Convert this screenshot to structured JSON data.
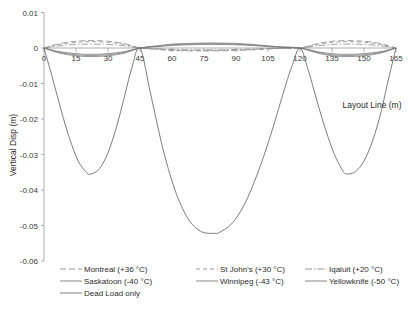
{
  "chart_data": {
    "type": "line",
    "title": "",
    "xlabel": "Layout Line (m)",
    "ylabel": "Vertical Disp (m)",
    "xlim": [
      0,
      165
    ],
    "ylim": [
      -0.06,
      0.01
    ],
    "xticks": [
      0,
      15,
      30,
      45,
      60,
      75,
      90,
      105,
      120,
      135,
      150,
      165
    ],
    "xtick_labels": [
      "0",
      "15",
      "30",
      "45",
      "60",
      "75",
      "90",
      "105",
      "120",
      "135",
      "150",
      "165"
    ],
    "yticks": [
      0.01,
      0,
      -0.01,
      -0.02,
      -0.03,
      -0.04,
      -0.05,
      -0.06
    ],
    "ytick_labels": [
      "0.01",
      "0",
      "-0.01",
      "-0.02",
      "-0.03",
      "-0.04",
      "-0.05",
      "-0.06"
    ],
    "grid": false,
    "legend_position": "bottom",
    "supports": [
      0,
      45,
      120,
      165
    ],
    "series": [
      {
        "name": "Montreal (+36 °C)",
        "label": "Montreal (+36 °C)",
        "color": "#8d8d8d",
        "dash": "6,3",
        "width": 0.8,
        "x": [
          0,
          7,
          15,
          22,
          30,
          38,
          45,
          53,
          60,
          68,
          75,
          82,
          90,
          98,
          105,
          112,
          120,
          128,
          135,
          142,
          150,
          158,
          165
        ],
        "y": [
          0,
          0.0012,
          0.0019,
          0.0021,
          0.0019,
          0.0012,
          0,
          -0.0004,
          -0.0007,
          -0.0008,
          -0.0008,
          -0.0008,
          -0.0007,
          -0.0005,
          -0.0003,
          -0.0001,
          0,
          0.0012,
          0.0019,
          0.0021,
          0.0019,
          0.0012,
          0
        ]
      },
      {
        "name": "St John's (+30 °C)",
        "label": "St John's (+30 °C)",
        "color": "#8d8d8d",
        "dash": "4,3",
        "width": 0.8,
        "x": [
          0,
          7,
          15,
          22,
          30,
          38,
          45,
          53,
          60,
          68,
          75,
          82,
          90,
          98,
          105,
          112,
          120,
          128,
          135,
          142,
          150,
          158,
          165
        ],
        "y": [
          0,
          0.001,
          0.0016,
          0.0018,
          0.0016,
          0.001,
          0,
          -0.0003,
          -0.0006,
          -0.0007,
          -0.0007,
          -0.0007,
          -0.0006,
          -0.0004,
          -0.0002,
          -0.0001,
          0,
          0.001,
          0.0016,
          0.0018,
          0.0016,
          0.001,
          0
        ]
      },
      {
        "name": "Iqaluit (+20 °C)",
        "label": "Iqaluit (+20 °C)",
        "color": "#8d8d8d",
        "dash": "7,2,1.5,2",
        "width": 0.8,
        "x": [
          0,
          7,
          15,
          22,
          30,
          38,
          45,
          53,
          60,
          68,
          75,
          82,
          90,
          98,
          105,
          112,
          120,
          128,
          135,
          142,
          150,
          158,
          165
        ],
        "y": [
          0,
          0.0006,
          0.001,
          0.0011,
          0.001,
          0.0006,
          0,
          -0.0002,
          -0.0004,
          -0.0005,
          -0.0005,
          -0.0005,
          -0.0004,
          -0.0003,
          -0.0001,
          0,
          0,
          0.0006,
          0.001,
          0.0011,
          0.001,
          0.0006,
          0
        ]
      },
      {
        "name": "Saskatoon (-40 °C)",
        "label": "Saskatoon (-40 °C)",
        "color": "#7a7a7a",
        "dash": "",
        "width": 0.8,
        "x": [
          0,
          7,
          15,
          22,
          30,
          38,
          45,
          53,
          60,
          68,
          75,
          82,
          90,
          98,
          105,
          112,
          120,
          128,
          135,
          142,
          150,
          158,
          165
        ],
        "y": [
          0,
          -0.001,
          -0.0016,
          -0.0018,
          -0.0016,
          -0.001,
          0,
          0.0004,
          0.0007,
          0.0009,
          0.001,
          0.001,
          0.0009,
          0.0007,
          0.0004,
          0.0002,
          0,
          -0.001,
          -0.0016,
          -0.0018,
          -0.0016,
          -0.001,
          0
        ]
      },
      {
        "name": "Winnipeg (-43 °C)",
        "label": "Winnipeg (-43 °C)",
        "color": "#7a7a7a",
        "dash": "",
        "width": 0.8,
        "x": [
          0,
          7,
          15,
          22,
          30,
          38,
          45,
          53,
          60,
          68,
          75,
          82,
          90,
          98,
          105,
          112,
          120,
          128,
          135,
          142,
          150,
          158,
          165
        ],
        "y": [
          0,
          -0.0012,
          -0.0019,
          -0.0021,
          -0.0019,
          -0.0012,
          0,
          0.0005,
          0.0009,
          0.0011,
          0.0012,
          0.0012,
          0.0011,
          0.0008,
          0.0005,
          0.0002,
          0,
          -0.0012,
          -0.0019,
          -0.0021,
          -0.0019,
          -0.0012,
          0
        ]
      },
      {
        "name": "Yellowknife (-50 °C)",
        "label": "Yellowknife (-50 °C)",
        "color": "#7a7a7a",
        "dash": "",
        "width": 0.8,
        "x": [
          0,
          7,
          15,
          22,
          30,
          38,
          45,
          53,
          60,
          68,
          75,
          82,
          90,
          98,
          105,
          112,
          120,
          128,
          135,
          142,
          150,
          158,
          165
        ],
        "y": [
          0,
          -0.0014,
          -0.0022,
          -0.0024,
          -0.0022,
          -0.0014,
          0,
          0.0006,
          0.0011,
          0.0013,
          0.0014,
          0.0014,
          0.0013,
          0.001,
          0.0006,
          0.0003,
          0,
          -0.0014,
          -0.0022,
          -0.0024,
          -0.0022,
          -0.0014,
          0
        ]
      },
      {
        "name": "Dead Load only",
        "label": "Dead Load only",
        "color": "#6e6e6e",
        "dash": "",
        "width": 0.9,
        "x": [
          0,
          4,
          8,
          12,
          16,
          20,
          22,
          26,
          30,
          34,
          38,
          41,
          45,
          50,
          56,
          62,
          68,
          74,
          80,
          82,
          88,
          94,
          100,
          106,
          112,
          116,
          120,
          124,
          128,
          132,
          136,
          140,
          142,
          146,
          150,
          154,
          158,
          161,
          165
        ],
        "y": [
          0,
          -0.0085,
          -0.0175,
          -0.0255,
          -0.0318,
          -0.0351,
          -0.0355,
          -0.034,
          -0.0295,
          -0.0222,
          -0.013,
          -0.006,
          0,
          -0.013,
          -0.029,
          -0.041,
          -0.0485,
          -0.0518,
          -0.0522,
          -0.052,
          -0.0495,
          -0.044,
          -0.0355,
          -0.025,
          -0.013,
          -0.0055,
          0,
          -0.0065,
          -0.015,
          -0.023,
          -0.0298,
          -0.0345,
          -0.0355,
          -0.0348,
          -0.0318,
          -0.0262,
          -0.018,
          -0.01,
          0
        ]
      }
    ]
  },
  "legend": {
    "rows": [
      [
        {
          "label": "Montreal (+36 °C)",
          "dash": "6,3",
          "color": "#8d8d8d"
        },
        {
          "label": "St John's (+30 °C)",
          "dash": "4,3",
          "color": "#8d8d8d"
        },
        {
          "label": "Iqaluit (+20 °C)",
          "dash": "7,2,1.5,2",
          "color": "#8d8d8d"
        }
      ],
      [
        {
          "label": "Saskatoon (-40 °C)",
          "dash": "",
          "color": "#7a7a7a"
        },
        {
          "label": "Winnipeg (-43 °C)",
          "dash": "",
          "color": "#7a7a7a"
        },
        {
          "label": "Yellowknife (-50 °C)",
          "dash": "",
          "color": "#7a7a7a"
        }
      ],
      [
        {
          "label": "Dead Load only",
          "dash": "",
          "color": "#6e6e6e"
        }
      ]
    ]
  }
}
